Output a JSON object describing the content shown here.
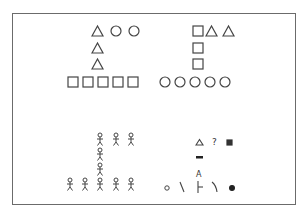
{
  "figure": {
    "stroke_color": "#444444",
    "frame_color": "#6b6b6b",
    "groups": [
      {
        "name": "top-left",
        "rows": [
          [
            "triangle",
            "circle",
            "circle"
          ],
          [
            "triangle"
          ],
          [
            "triangle"
          ],
          [
            "square",
            "square",
            "square",
            "square",
            "square"
          ]
        ]
      },
      {
        "name": "top-right",
        "rows": [
          [
            "square",
            "triangle",
            "triangle"
          ],
          [
            "square"
          ],
          [
            "square"
          ],
          [
            "circle",
            "circle",
            "circle",
            "circle",
            "circle"
          ]
        ]
      },
      {
        "name": "bottom-left",
        "rows": [
          [
            "stick-figure",
            "stick-figure",
            "stick-figure"
          ],
          [
            "stick-figure"
          ],
          [
            "stick-figure"
          ],
          [
            "stick-figure",
            "stick-figure",
            "stick-figure",
            "stick-figure",
            "stick-figure"
          ]
        ]
      },
      {
        "name": "bottom-right",
        "rows": [
          [
            "small-triangle",
            "question-mark",
            "small-filled-square"
          ],
          [
            "dash"
          ],
          [
            "A"
          ],
          [
            "small-circle",
            "backslash",
            "tee",
            "right-paren-curve",
            "filled-dot"
          ]
        ]
      }
    ],
    "text_glyphs": {
      "question": "?",
      "letter_a": "A"
    }
  }
}
